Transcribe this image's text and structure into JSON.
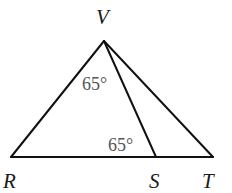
{
  "diagram": {
    "type": "triangle",
    "vertices": {
      "V": {
        "label": "V",
        "x": 104,
        "y": 41
      },
      "R": {
        "label": "R",
        "x": 11,
        "y": 157
      },
      "S": {
        "label": "S",
        "x": 156,
        "y": 157
      },
      "T": {
        "label": "T",
        "x": 213,
        "y": 157
      }
    },
    "segments": [
      "VR",
      "VS",
      "VT",
      "RT"
    ],
    "angles": [
      {
        "at": "V",
        "between": "RV,VS",
        "label": "65°"
      },
      {
        "at": "S",
        "between": "RS,SV",
        "label": "65°"
      }
    ],
    "colors": {
      "line": "#111111",
      "vertex_label": "#1a1a1a",
      "angle_label": "#555555"
    }
  }
}
